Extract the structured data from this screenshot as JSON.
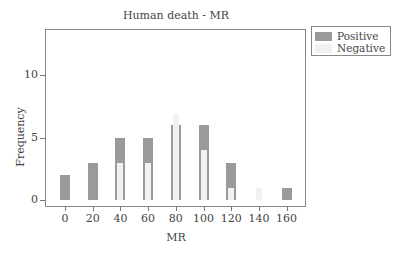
{
  "chart_data": {
    "type": "bar",
    "title": "Human death - MR",
    "xlabel": "MR",
    "ylabel": "Frequency",
    "categories": [
      "0",
      "20",
      "40",
      "60",
      "80",
      "100",
      "120",
      "140",
      "160"
    ],
    "series": [
      {
        "name": "Positive",
        "color": "#9a9a9a",
        "values": [
          2,
          3,
          5,
          5,
          6,
          6,
          3,
          0,
          1
        ]
      },
      {
        "name": "Negative",
        "color": "#f1f1f1",
        "values": [
          0,
          0,
          3,
          3,
          7,
          4,
          1,
          1,
          0
        ]
      }
    ],
    "yticks": [
      "0",
      "5",
      "10"
    ],
    "ylim": [
      -0.5,
      13.8
    ],
    "grid": false,
    "legend_position": "outside-top-right"
  },
  "legend": {
    "positive_label": "Positive",
    "negative_label": "Negative"
  }
}
